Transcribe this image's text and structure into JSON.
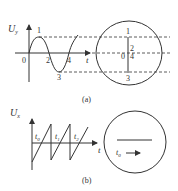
{
  "figure_a": {
    "caption": "(a)",
    "graph": {
      "y_axis_label": "U",
      "y_axis_subscript": "y",
      "x_axis_label": "t",
      "origin_label": "0",
      "points": [
        {
          "label": "1",
          "desc": "peak"
        },
        {
          "label": "2",
          "desc": "zero crossing"
        },
        {
          "label": "3",
          "desc": "trough"
        },
        {
          "label": "4",
          "desc": "zero crossing"
        }
      ]
    },
    "screen": {
      "label_top": "1",
      "label_mid_a": "2",
      "label_mid_b": "4",
      "label_origin": "0",
      "label_bottom": "3"
    }
  },
  "figure_b": {
    "caption": "(b)",
    "graph": {
      "y_axis_label": "U",
      "y_axis_subscript": "x",
      "x_axis_label": "t",
      "time_labels": [
        {
          "base": "t",
          "sub": "0"
        },
        {
          "base": "t",
          "sub": "1"
        },
        {
          "base": "t",
          "sub": "2"
        }
      ]
    },
    "screen": {
      "spot_label_base": "t",
      "spot_label_sub": "0"
    }
  },
  "colors": {
    "stroke": "#333333",
    "background": "#ffffff"
  }
}
